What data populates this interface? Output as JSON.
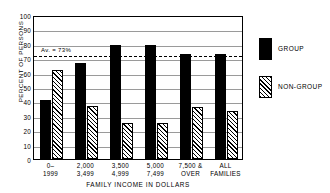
{
  "chart_data": {
    "type": "bar",
    "title": "",
    "xlabel": "FAMILY INCOME IN DOLLARS",
    "ylabel": "PERCENT OF PERSONS",
    "ylim": [
      0,
      100
    ],
    "ytick_step": 10,
    "yticks": [
      "100",
      "90",
      "80",
      "70",
      "60",
      "50",
      "40",
      "30",
      "20",
      "10",
      "0"
    ],
    "grid": true,
    "legend_position": "right",
    "categories": [
      {
        "line1": "0–",
        "line2": "1999"
      },
      {
        "line1": "2,000",
        "line2": "3,499"
      },
      {
        "line1": "3,500",
        "line2": "4,999"
      },
      {
        "line1": "5,000",
        "line2": "7,499"
      },
      {
        "line1": "7,500 &",
        "line2": "OVER"
      },
      {
        "line1": "ALL",
        "line2": "FAMILIES"
      }
    ],
    "series": [
      {
        "name": "GROUP",
        "color": "#000000",
        "pattern": "solid",
        "values": [
          41,
          67,
          79,
          79,
          73,
          73
        ]
      },
      {
        "name": "NON-GROUP",
        "color": "#000000",
        "pattern": "diagonal-hatch",
        "values": [
          62,
          37,
          25,
          25,
          36,
          33
        ]
      }
    ],
    "annotations": [
      {
        "name": "average-line",
        "label": "Av. = 73%",
        "value": 73,
        "style": "dashed-horizontal"
      }
    ]
  }
}
